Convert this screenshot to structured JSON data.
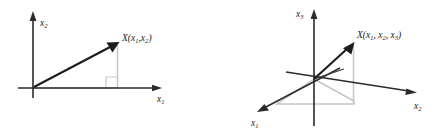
{
  "figure": {
    "name": "vector-representation-figure",
    "background_color": "#ffffff",
    "ink_color": "#1c1c1c",
    "guide_color": "#c6c6c6"
  },
  "panels": [
    {
      "id": "2d",
      "caption": "",
      "axes": [
        {
          "name": "vertical-axis",
          "label_base": "x",
          "label_sub": "2",
          "label_full": "x2"
        },
        {
          "name": "horizontal-axis",
          "label_base": "x",
          "label_sub": "1",
          "label_full": "x1"
        }
      ],
      "point": {
        "name": "vector-endpoint",
        "prefix": "X(",
        "base": "x",
        "sub1": "1",
        "comma": ",",
        "sub2": "2",
        "suffix": ")",
        "label_full": "X(x1,x2)"
      },
      "guides": {
        "right_angle_marker": true,
        "vertical_dropline": true,
        "horizontal_baseline": true
      }
    },
    {
      "id": "3d",
      "caption": "",
      "axes": [
        {
          "name": "x3-axis",
          "label_base": "x",
          "label_sub": "3",
          "label_full": "x3"
        },
        {
          "name": "x2-axis",
          "label_base": "x",
          "label_sub": "2",
          "label_full": "x2"
        },
        {
          "name": "x1-axis",
          "label_base": "x",
          "label_sub": "1",
          "label_full": "x1"
        }
      ],
      "point": {
        "name": "vector-endpoint",
        "prefix": "X(",
        "base": "x",
        "sub1": "1",
        "comma1": ",",
        "sub2": "2",
        "comma2": ",",
        "sub3": "3",
        "suffix": ")",
        "label_full": "X(x1, x2, x3)"
      },
      "guides": {
        "projection_parallelogram": true,
        "vertical_dropline": true,
        "short_projection_segment": true
      }
    }
  ]
}
